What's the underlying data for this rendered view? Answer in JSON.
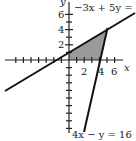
{
  "diagram": {
    "type": "coordinate-graph",
    "axes": {
      "x_label": "x",
      "y_label": "y",
      "x_tick_labels": [
        "2",
        "4",
        "6"
      ],
      "y_tick_labels": [
        "2",
        "4",
        "6"
      ]
    },
    "lines": [
      {
        "equation": "−3x + 5y = 5",
        "points": [
          [
            -8.5,
            -4.1
          ],
          [
            8.7,
            6.2
          ]
        ]
      },
      {
        "equation": "4x − y = 16",
        "points": [
          [
            2.0,
            -8.0
          ],
          [
            5.0,
            4.0
          ]
        ]
      }
    ],
    "shaded_region": {
      "vertices": [
        [
          0,
          0
        ],
        [
          0,
          1
        ],
        [
          5,
          4
        ],
        [
          4,
          0
        ]
      ],
      "color": "#9a9a9a"
    },
    "colors": {
      "line": "#111111",
      "axis": "#222222",
      "shade": "#9a9a9a"
    }
  }
}
